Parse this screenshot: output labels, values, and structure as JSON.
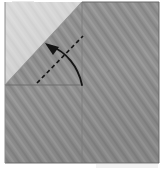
{
  "figure": {
    "title": "Origami fold step diagram",
    "background_color": "#ffffff",
    "width": 165,
    "height": 171
  },
  "paper": {
    "name": "square-sheet",
    "base_color": "#919191",
    "texture_color": "#9e9e9e",
    "texture_shadow": "#828282",
    "texture_angle_deg": 55,
    "bounds": {
      "left": 5,
      "top": 2,
      "right": 159,
      "bottom": 163
    },
    "edge_color": "#7c7c7c"
  },
  "folded_flap": {
    "name": "top-left-folded-triangle",
    "fill_color": "#d4d4d4",
    "highlight_color": "#dedede",
    "shadow_color": "#c2c2c2",
    "points": "5,2 82,2 5,85",
    "diagonal_from": {
      "x": 82,
      "y": 2
    },
    "diagonal_to": {
      "x": 5,
      "y": 85
    }
  },
  "creases": [
    {
      "name": "horizontal-crease",
      "from": {
        "x": 5,
        "y": 85
      },
      "to": {
        "x": 82,
        "y": 85
      },
      "color": "#6e6e6e",
      "style": "solid"
    },
    {
      "name": "vertical-crease",
      "from": {
        "x": 82,
        "y": 2
      },
      "to": {
        "x": 82,
        "y": 163
      },
      "color": "#7a7a7a",
      "style": "solid"
    }
  ],
  "fold_line": {
    "name": "valley-fold-dashed-line",
    "from": {
      "x": 37,
      "y": 83
    },
    "to": {
      "x": 83,
      "y": 36
    },
    "color": "#161616",
    "style": "dashed",
    "dash_pattern": "4 3",
    "stroke_width": 1.6
  },
  "arrow": {
    "name": "fold-direction-arrow",
    "color": "#141414",
    "stroke_width": 1.7,
    "path": "M 82,85 C 78,66 66,52 51,46",
    "tip": {
      "x": 46,
      "y": 44
    },
    "tail": {
      "x": 82,
      "y": 85
    },
    "head_points": "46,44 58,47 54,54",
    "direction": "up-left"
  },
  "artifacts": [
    {
      "name": "top-left-scan-mark",
      "x": 12,
      "y": 1,
      "width": 22,
      "height": 3,
      "color": "#e8e8e8"
    },
    {
      "name": "bottom-right-scan-mark",
      "x": 96,
      "y": 164,
      "width": 62,
      "height": 4,
      "color": "#f0f0f0"
    }
  ]
}
